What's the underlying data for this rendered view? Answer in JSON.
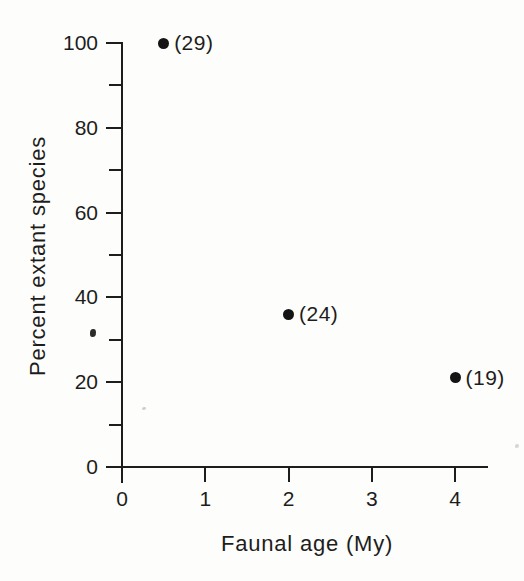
{
  "figure": {
    "background": "#fdfdfb",
    "ink": "#1d1d1d"
  },
  "chart_data": {
    "type": "scatter",
    "title": "",
    "xlabel": "Faunal age (My)",
    "ylabel": "Percent extant species",
    "xlim": [
      0,
      4.4
    ],
    "ylim": [
      0,
      104
    ],
    "grid": false,
    "legend": false,
    "x_ticks": [
      {
        "value": 0,
        "label": "0"
      },
      {
        "value": 1,
        "label": "1"
      },
      {
        "value": 2,
        "label": "2"
      },
      {
        "value": 3,
        "label": "3"
      },
      {
        "value": 4,
        "label": "4"
      }
    ],
    "y_ticks_major": [
      {
        "value": 0,
        "label": "0"
      },
      {
        "value": 20,
        "label": "20"
      },
      {
        "value": 40,
        "label": "40"
      },
      {
        "value": 60,
        "label": "60"
      },
      {
        "value": 80,
        "label": "80"
      },
      {
        "value": 100,
        "label": "100"
      }
    ],
    "y_ticks_minor": [
      10,
      30,
      50,
      70,
      90
    ],
    "marker": {
      "shape": "circle",
      "diameter_px": 11,
      "color": "#141414"
    },
    "points": [
      {
        "x": 0.5,
        "y": 100,
        "annotation": "(29)"
      },
      {
        "x": 2.0,
        "y": 36,
        "annotation": "(24)"
      },
      {
        "x": 4.0,
        "y": 21,
        "annotation": "(19)"
      }
    ]
  },
  "scan_artifacts": [
    {
      "x_px": 90,
      "y_px": 329,
      "w_px": 6,
      "h_px": 8,
      "color": "#2b2b2b"
    },
    {
      "x_px": 142,
      "y_px": 407,
      "w_px": 4,
      "h_px": 3,
      "color": "#cfcfca"
    },
    {
      "x_px": 515,
      "y_px": 444,
      "w_px": 4,
      "h_px": 4,
      "color": "#d6d6d2"
    }
  ]
}
